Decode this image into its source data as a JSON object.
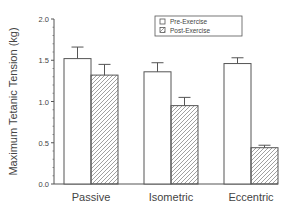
{
  "chart_data": {
    "type": "bar",
    "title": "",
    "xlabel": "",
    "ylabel": "Maximum Tetanic Tension (kg)",
    "ylim": [
      0,
      2.0
    ],
    "yticks": [
      "0.0",
      "0.5",
      "1.0",
      "1.5",
      "2.0"
    ],
    "categories": [
      "Passive",
      "Isometric",
      "Eccentric"
    ],
    "series": [
      {
        "name": "Pre-Exercise",
        "fill": "open",
        "values": [
          1.52,
          1.36,
          1.46
        ],
        "errors": [
          0.14,
          0.11,
          0.07
        ]
      },
      {
        "name": "Post-Exercise",
        "fill": "hatched",
        "values": [
          1.32,
          0.95,
          0.44
        ],
        "errors": [
          0.13,
          0.1,
          0.03
        ]
      }
    ],
    "legend_position": "upper right",
    "grid": false
  },
  "colors": {
    "line": "#555555",
    "text": "#444444",
    "background": "#ffffff"
  }
}
